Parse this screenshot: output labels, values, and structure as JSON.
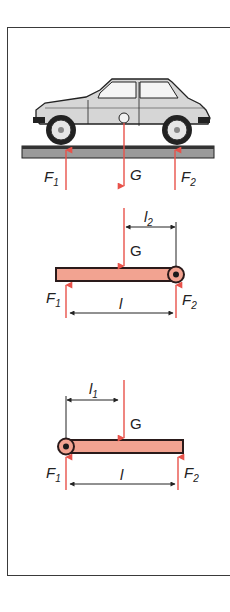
{
  "colors": {
    "force_arrow": "#e8524a",
    "beam_fill": "#f2a391",
    "beam_stroke": "#2a1a1a",
    "car_body": "#d6d6d6",
    "ground": "#8a8a8a",
    "frame": "#3a3a3a"
  },
  "panel_car": {
    "labels": {
      "F1": "F",
      "F1_sub": "1",
      "G": "G",
      "F2": "F",
      "F2_sub": "2"
    }
  },
  "panel_beam_pivot_right": {
    "labels": {
      "G": "G",
      "F1": "F",
      "F1_sub": "1",
      "F2": "F",
      "F2_sub": "2",
      "l": "l",
      "l2": "l",
      "l2_sub": "2"
    }
  },
  "panel_beam_pivot_left": {
    "labels": {
      "G": "G",
      "F1": "F",
      "F1_sub": "1",
      "F2": "F",
      "F2_sub": "2",
      "l": "l",
      "l1": "l",
      "l1_sub": "1"
    }
  }
}
